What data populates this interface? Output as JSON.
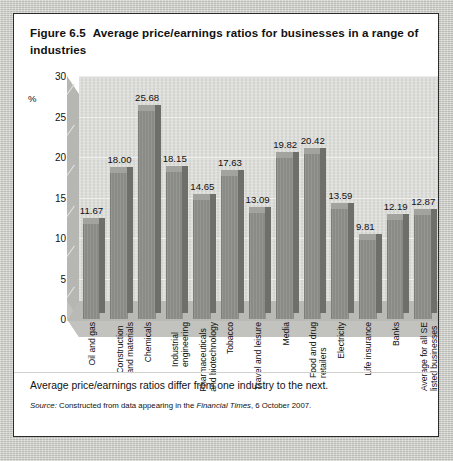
{
  "figure": {
    "number": "Figure 6.5",
    "title": "Average price/earnings ratios for businesses in a range of industries",
    "caption": "Average price/earnings ratios differ from one industry to the next.",
    "source_prefix": "Source:",
    "source_text_before": " Constructed from data appearing in the ",
    "source_publication": "Financial Times",
    "source_text_after": ", 6 October 2007."
  },
  "chart_data": {
    "type": "bar",
    "title": "Average price/earnings ratios for businesses in a range of industries",
    "xlabel": "",
    "ylabel": "%",
    "ylim": [
      0,
      30
    ],
    "yticks": [
      0,
      5,
      10,
      15,
      20,
      25,
      30
    ],
    "grid": true,
    "legend": "none",
    "categories": [
      "Oil and gas",
      "Construction and materials",
      "Chemicals",
      "Industrial engineering",
      "Pharmaceuticals and biotechnology",
      "Tobacco",
      "Travel and leisure",
      "Media",
      "Food and drug retailers",
      "Electricity",
      "Life insurance",
      "Banks",
      "Average for all SE listed businesses"
    ],
    "category_lines": [
      [
        "Oil and gas"
      ],
      [
        "Construction",
        "and materials"
      ],
      [
        "Chemicals"
      ],
      [
        "Industrial",
        "engineering"
      ],
      [
        "Pharmaceuticals",
        "and biotechnology"
      ],
      [
        "Tobacco"
      ],
      [
        "Travel and leisure"
      ],
      [
        "Media"
      ],
      [
        "Food and drug",
        "retailers"
      ],
      [
        "Electricity"
      ],
      [
        "Life insurance"
      ],
      [
        "Banks"
      ],
      [
        "Average for all SE",
        "listed businesses"
      ]
    ],
    "values": [
      11.67,
      18.0,
      25.68,
      18.15,
      14.65,
      17.63,
      13.09,
      19.82,
      20.42,
      13.59,
      9.81,
      12.19,
      12.87
    ],
    "value_labels": [
      "11.67",
      "18.00",
      "25.68",
      "18.15",
      "14.65",
      "17.63",
      "13.09",
      "19.82",
      "20.42",
      "13.59",
      "9.81",
      "12.19",
      "12.87"
    ]
  },
  "colors": {
    "bar_front": "#8e8e8a",
    "bar_side": "#6e6e6a",
    "bar_top": "#a2a29e",
    "plot_back_wall": "#d9d9d6",
    "page_background": "#c5c5c0",
    "figure_background": "#ffffff",
    "text": "#111111"
  }
}
